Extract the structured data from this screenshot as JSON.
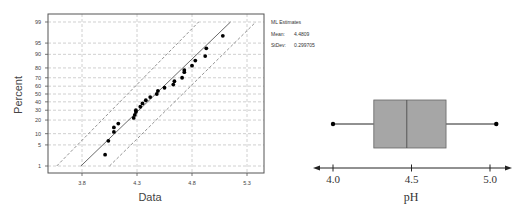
{
  "chart_data": [
    {
      "type": "scatter",
      "subtype": "normal-probability-plot",
      "title": "",
      "xlabel": "Data",
      "ylabel": "Percent",
      "x_ticks": [
        3.8,
        4.3,
        4.8,
        5.3
      ],
      "x_tick_labels": [
        "3.8",
        "4.3",
        "4.8",
        "5.3"
      ],
      "y_ticks": [
        1,
        5,
        10,
        20,
        30,
        40,
        50,
        60,
        70,
        80,
        90,
        95,
        99
      ],
      "y_tick_labels": [
        "1",
        "5",
        "10",
        "20",
        "30",
        "40",
        "50",
        "60",
        "70",
        "80",
        "90",
        "95",
        "99"
      ],
      "xlim": [
        3.55,
        5.45
      ],
      "grid": true,
      "legend": {
        "title": "ML Estimates",
        "items": [
          {
            "label": "Mean:",
            "value": "4.4809"
          },
          {
            "label": "StDev:",
            "value": "0.299705"
          }
        ],
        "position": "right-top"
      },
      "series": [
        {
          "name": "observations",
          "points": [
            {
              "x": 4.01,
              "p": 2.5
            },
            {
              "x": 4.04,
              "p": 6.5
            },
            {
              "x": 4.09,
              "p": 11
            },
            {
              "x": 4.09,
              "p": 14
            },
            {
              "x": 4.13,
              "p": 17
            },
            {
              "x": 4.27,
              "p": 22
            },
            {
              "x": 4.28,
              "p": 25
            },
            {
              "x": 4.29,
              "p": 28
            },
            {
              "x": 4.29,
              "p": 30
            },
            {
              "x": 4.33,
              "p": 34
            },
            {
              "x": 4.35,
              "p": 38
            },
            {
              "x": 4.38,
              "p": 42
            },
            {
              "x": 4.42,
              "p": 46
            },
            {
              "x": 4.48,
              "p": 50
            },
            {
              "x": 4.49,
              "p": 54
            },
            {
              "x": 4.55,
              "p": 58
            },
            {
              "x": 4.63,
              "p": 62
            },
            {
              "x": 4.64,
              "p": 66
            },
            {
              "x": 4.71,
              "p": 70
            },
            {
              "x": 4.73,
              "p": 76
            },
            {
              "x": 4.73,
              "p": 78
            },
            {
              "x": 4.8,
              "p": 82
            },
            {
              "x": 4.83,
              "p": 86
            },
            {
              "x": 4.92,
              "p": 89
            },
            {
              "x": 4.93,
              "p": 93
            },
            {
              "x": 5.08,
              "p": 97
            }
          ]
        },
        {
          "name": "fitted-line",
          "from": {
            "x": 3.79,
            "p": 1
          },
          "to": {
            "x": 5.15,
            "p": 99
          }
        },
        {
          "name": "upper-ci",
          "from": {
            "x": 3.57,
            "p": 1
          },
          "to": {
            "x": 4.86,
            "p": 99
          }
        },
        {
          "name": "lower-ci",
          "from": {
            "x": 4.05,
            "p": 1
          },
          "to": {
            "x": 5.38,
            "p": 99
          }
        }
      ]
    },
    {
      "type": "boxplot",
      "title": "",
      "xlabel": "pH",
      "x_ticks": [
        4.0,
        4.5,
        5.0
      ],
      "x_tick_labels": [
        "4.0",
        "4.5",
        "5.0"
      ],
      "min": 4.0,
      "q1": 4.26,
      "median": 4.47,
      "q3": 4.72,
      "max": 5.04,
      "box_color": "#a6a6a6"
    }
  ],
  "colors": {
    "box_fill": "#a6a6a6",
    "grid": "#c8c8c8",
    "line": "#333333",
    "points": "#000000"
  }
}
